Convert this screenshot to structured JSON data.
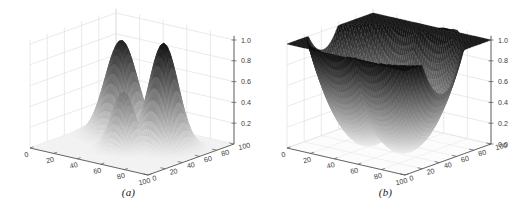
{
  "figure": {
    "background_color": "#ffffff",
    "panel_count": 2
  },
  "panels": [
    {
      "id": "panel-a",
      "caption": "(a)",
      "chart_data": {
        "type": "surface",
        "title": "",
        "xlabel": "",
        "ylabel": "",
        "zlabel": "",
        "colormap": "grayscale-inverted",
        "grid": true,
        "legend": "none",
        "xlim": [
          0,
          100
        ],
        "ylim": [
          0,
          100
        ],
        "zlim": [
          0,
          1.0
        ],
        "x_ticks": [
          0,
          20,
          40,
          60,
          80,
          100
        ],
        "x_tick_labels": [
          "0",
          "20",
          "40",
          "60",
          "80",
          "100"
        ],
        "y_ticks": [
          0,
          20,
          40,
          60,
          80,
          100
        ],
        "y_tick_labels": [
          "0",
          "20",
          "40",
          "60",
          "80",
          "100"
        ],
        "z_ticks": [
          0.2,
          0.4,
          0.6,
          0.8,
          1.0
        ],
        "z_tick_labels": [
          "0.2",
          "0.4",
          "0.6",
          "0.8",
          "1.0"
        ],
        "description": "Three Gaussian peaks rising from a dark flat basin",
        "peaks": [
          {
            "x": 30,
            "y": 65,
            "height": 0.92,
            "sigma": 11
          },
          {
            "x": 68,
            "y": 62,
            "height": 1.0,
            "sigma": 10
          },
          {
            "x": 50,
            "y": 40,
            "height": 0.55,
            "sigma": 8
          }
        ]
      }
    },
    {
      "id": "panel-b",
      "caption": "(b)",
      "chart_data": {
        "type": "surface",
        "title": "",
        "xlabel": "",
        "ylabel": "",
        "zlabel": "",
        "colormap": "grayscale-inverted",
        "grid": true,
        "legend": "none",
        "xlim": [
          0,
          100
        ],
        "ylim": [
          0,
          100
        ],
        "zlim": [
          0,
          1.0
        ],
        "x_ticks": [
          0,
          20,
          40,
          60,
          80,
          100
        ],
        "x_tick_labels": [
          "0",
          "20",
          "40",
          "60",
          "80",
          "100"
        ],
        "y_ticks": [
          0,
          20,
          40,
          60,
          80,
          100
        ],
        "y_tick_labels": [
          "0",
          "20",
          "40",
          "60",
          "80",
          "100"
        ],
        "z_ticks": [
          0.0,
          0.2,
          0.4,
          0.6,
          0.8,
          1.0
        ],
        "z_tick_labels": [
          "0.0",
          "0.2",
          "0.4",
          "0.6",
          "0.8",
          "1.0"
        ],
        "description": "Inverted bowl/funnel surface with high rising walls and a dark twin spike at the far corner",
        "wells": [
          {
            "x": 38,
            "y": 42,
            "depth": 0.0
          },
          {
            "x": 66,
            "y": 44,
            "depth": 0.0
          }
        ]
      }
    }
  ],
  "axis_style": {
    "grid_color": "#d8d8d8",
    "axis_color": "#555555",
    "tick_label_color": "#3c3c3c",
    "surface_dark": "#161616",
    "surface_light": "#f2f2f2"
  }
}
